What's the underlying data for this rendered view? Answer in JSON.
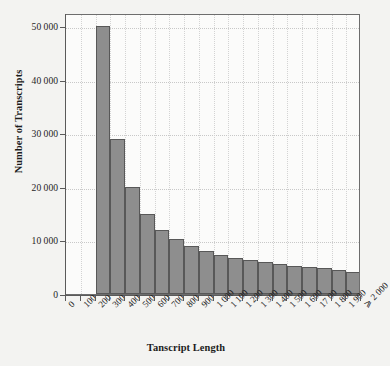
{
  "chart_data": {
    "type": "bar",
    "title": "",
    "xlabel": "Tanscript Length",
    "ylabel": "Number of Transcripts",
    "grid": true,
    "legend": false,
    "ylim": [
      0,
      52500
    ],
    "yticks": [
      0,
      10000,
      20000,
      30000,
      40000,
      50000
    ],
    "ytick_labels": [
      "0",
      "10 000",
      "20 000",
      "30 000",
      "40 000",
      "50 000"
    ],
    "xtick_labels": [
      "0",
      "100",
      "200",
      "300",
      "400",
      "500",
      "600",
      "700",
      "800",
      "900",
      "1 000",
      "1 100",
      "1 200",
      "1 300",
      "1 400",
      "1 500",
      "1 600",
      "17 00",
      "1 800",
      "1 900",
      "⩾ 2 000"
    ],
    "bar_color": "#8e8e8e",
    "bar_edge_color": "#585858",
    "plot_background": "#fbfbfa",
    "page_background": "#f3f3f1",
    "categories": [
      "200",
      "300",
      "400",
      "500",
      "600",
      "700",
      "800",
      "900",
      "1 000",
      "1 100",
      "1 200",
      "1 300",
      "1 400",
      "1 500",
      "1 600",
      "17 00",
      "1 800",
      "1 900",
      "⩾ 2 000"
    ],
    "values": [
      50000,
      29000,
      20000,
      15000,
      12000,
      10200,
      8900,
      8100,
      7200,
      6800,
      6400,
      5900,
      5600,
      5300,
      5100,
      4800,
      4500,
      4200,
      47200
    ],
    "bin_start_index": 2
  },
  "axes": {
    "y_title": "Number of Transcripts",
    "x_title": "Tanscript Length"
  }
}
